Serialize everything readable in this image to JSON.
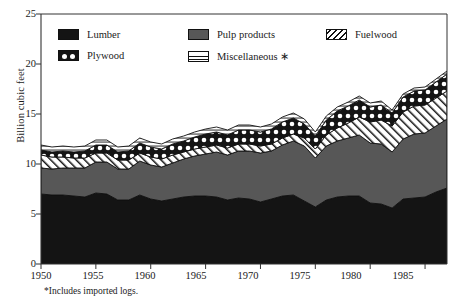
{
  "chart_data": {
    "type": "area",
    "title": "",
    "subtitle": "",
    "xlabel": "",
    "ylabel": "Billion cubic feet",
    "xlim": [
      1950,
      1987
    ],
    "ylim": [
      0,
      25
    ],
    "grid": false,
    "stacked": true,
    "legend_position": "top-inside",
    "footnote": "*Includes imported logs.",
    "xticks": [
      1950,
      1955,
      1960,
      1965,
      1970,
      1975,
      1980,
      1985
    ],
    "xticklabels": [
      "1950",
      "1955",
      "1960",
      "1965",
      "1970",
      "1975",
      "1980",
      "1985"
    ],
    "yticks": [
      0,
      5,
      10,
      15,
      20,
      25
    ],
    "yticklabels": [
      "0",
      "5",
      "10",
      "15",
      "20",
      "25"
    ],
    "x": [
      1950,
      1951,
      1952,
      1953,
      1954,
      1955,
      1956,
      1957,
      1958,
      1959,
      1960,
      1961,
      1962,
      1963,
      1964,
      1965,
      1966,
      1967,
      1968,
      1969,
      1970,
      1971,
      1972,
      1973,
      1974,
      1975,
      1976,
      1977,
      1978,
      1979,
      1980,
      1981,
      1982,
      1983,
      1984,
      1985,
      1986,
      1987
    ],
    "series": [
      {
        "name": "Lumber",
        "color": "#141414",
        "pattern": "solid-black",
        "values": [
          7.0,
          6.9,
          6.9,
          6.8,
          6.7,
          7.1,
          7.0,
          6.4,
          6.4,
          6.9,
          6.5,
          6.3,
          6.5,
          6.7,
          6.8,
          6.8,
          6.7,
          6.4,
          6.6,
          6.5,
          6.2,
          6.5,
          6.8,
          6.9,
          6.3,
          5.7,
          6.4,
          6.7,
          6.8,
          6.8,
          6.1,
          6.0,
          5.6,
          6.5,
          6.6,
          6.7,
          7.2,
          7.6
        ]
      },
      {
        "name": "Pulp products",
        "color": "#575757",
        "pattern": "solid-gray",
        "values": [
          2.6,
          2.6,
          2.7,
          2.8,
          2.9,
          3.1,
          3.2,
          3.1,
          3.1,
          3.4,
          3.4,
          3.4,
          3.6,
          3.8,
          4.0,
          4.2,
          4.5,
          4.5,
          4.7,
          4.8,
          4.9,
          4.8,
          5.1,
          5.4,
          5.5,
          4.9,
          5.4,
          5.6,
          5.8,
          6.1,
          6.0,
          6.0,
          5.6,
          6.0,
          6.4,
          6.4,
          6.6,
          6.9
        ]
      },
      {
        "name": "Fuelwood",
        "color": "#ffffff",
        "pattern": "diagonal-hatch",
        "values": [
          1.3,
          1.2,
          1.1,
          1.0,
          1.0,
          0.9,
          0.9,
          0.9,
          0.9,
          0.8,
          0.8,
          0.8,
          0.8,
          0.7,
          0.7,
          0.7,
          0.7,
          0.7,
          0.7,
          0.7,
          0.7,
          0.7,
          0.7,
          0.7,
          0.8,
          0.9,
          1.1,
          1.3,
          1.5,
          1.8,
          2.1,
          2.4,
          2.6,
          2.7,
          2.8,
          2.8,
          2.8,
          2.8
        ]
      },
      {
        "name": "Plywood",
        "color": "#141414",
        "pattern": "black-with-white-dots",
        "values": [
          0.5,
          0.5,
          0.6,
          0.6,
          0.7,
          0.8,
          0.8,
          0.8,
          0.9,
          1.0,
          1.0,
          1.0,
          1.1,
          1.1,
          1.2,
          1.3,
          1.3,
          1.3,
          1.4,
          1.4,
          1.4,
          1.5,
          1.6,
          1.6,
          1.4,
          1.3,
          1.5,
          1.7,
          1.7,
          1.7,
          1.5,
          1.5,
          1.3,
          1.5,
          1.5,
          1.5,
          1.6,
          1.7
        ]
      },
      {
        "name": "Miscellaneous",
        "color": "#ffffff",
        "pattern": "white-horizontal-lines",
        "values": [
          0.5,
          0.5,
          0.5,
          0.5,
          0.5,
          0.5,
          0.5,
          0.5,
          0.5,
          0.5,
          0.5,
          0.5,
          0.5,
          0.5,
          0.5,
          0.5,
          0.5,
          0.5,
          0.5,
          0.5,
          0.5,
          0.5,
          0.5,
          0.5,
          0.5,
          0.4,
          0.4,
          0.4,
          0.4,
          0.4,
          0.4,
          0.4,
          0.3,
          0.3,
          0.3,
          0.3,
          0.3,
          0.3
        ]
      }
    ]
  },
  "legend": {
    "items": [
      {
        "label": "Lumber",
        "swatch": "sw-lumber",
        "icon": "lumber-swatch-icon"
      },
      {
        "label": "Pulp products",
        "swatch": "sw-pulp",
        "icon": "pulp-products-swatch-icon"
      },
      {
        "label": "Fuelwood",
        "swatch": "sw-fuelwood",
        "icon": "fuelwood-swatch-icon"
      },
      {
        "label": "Plywood",
        "swatch": "sw-plywood",
        "icon": "plywood-swatch-icon"
      },
      {
        "label": "Miscellaneous ∗",
        "swatch": "sw-misc",
        "icon": "miscellaneous-swatch-icon"
      }
    ]
  }
}
